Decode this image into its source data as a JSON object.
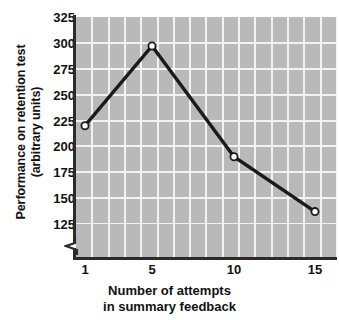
{
  "chart_data": {
    "type": "line",
    "title": "",
    "xlabel": "Number of attempts in summary feedback",
    "xlabel_line1": "Number of attempts",
    "xlabel_line2": "in summary feedback",
    "ylabel": "Performance on retention test (arbitrary units)",
    "ylabel_line1": "Performance on retention test",
    "ylabel_line2": "(arbitrary units)",
    "x": [
      1,
      5,
      10,
      15
    ],
    "xtick_labels": [
      "1",
      "5",
      "10",
      "15"
    ],
    "values": [
      220,
      297,
      190,
      137
    ],
    "ytick_labels": [
      "325",
      "300",
      "275",
      "250",
      "225",
      "200",
      "175",
      "150",
      "125"
    ],
    "yticks": [
      325,
      300,
      275,
      250,
      225,
      200,
      175,
      150,
      125
    ],
    "ylim": [
      125,
      325
    ],
    "y_axis_break": true,
    "grid": true,
    "legend": "none",
    "series": [
      {
        "name": "Retention performance",
        "values": [
          220,
          297,
          190,
          137
        ],
        "marker": "open-circle",
        "line_color": "#1a1a1a",
        "marker_face_color": "#ffffff"
      }
    ],
    "colors": {
      "plot_background": "#b9b9b9",
      "gridline": "#f2f2f2",
      "axis": "#2b2b2b",
      "text": "#111111",
      "page_background": "#ffffff"
    }
  }
}
